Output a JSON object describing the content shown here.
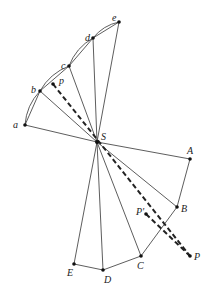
{
  "diagram": {
    "center": {
      "label": "S",
      "x": 97,
      "y": 142
    },
    "upper_points": [
      {
        "label": "a",
        "x": 25,
        "y": 125,
        "lx": 13,
        "ly": 128
      },
      {
        "label": "b",
        "x": 40,
        "y": 91,
        "lx": 31,
        "ly": 93
      },
      {
        "label": "c",
        "x": 69,
        "y": 66,
        "lx": 61,
        "ly": 69
      },
      {
        "label": "d",
        "x": 93,
        "y": 38,
        "lx": 85,
        "ly": 41
      },
      {
        "label": "e",
        "x": 119,
        "y": 22,
        "lx": 112,
        "ly": 21
      }
    ],
    "lower_points": [
      {
        "label": "A",
        "x": 190,
        "y": 159,
        "lx": 187,
        "ly": 154
      },
      {
        "label": "B",
        "x": 177,
        "y": 207,
        "lx": 181,
        "ly": 212
      },
      {
        "label": "C",
        "x": 141,
        "y": 256,
        "lx": 137,
        "ly": 269
      },
      {
        "label": "D",
        "x": 103,
        "y": 270,
        "lx": 104,
        "ly": 283
      },
      {
        "label": "E",
        "x": 74,
        "y": 264,
        "lx": 67,
        "ly": 276
      }
    ],
    "p_small": {
      "label": "p",
      "x": 53,
      "y": 84,
      "lx": 59,
      "ly": 84
    },
    "P": {
      "label": "P",
      "x": 190,
      "y": 256,
      "lx": 194,
      "ly": 260
    },
    "P_prime": {
      "label": "P'",
      "x": 146,
      "y": 214,
      "lx": 136,
      "ly": 215
    }
  }
}
